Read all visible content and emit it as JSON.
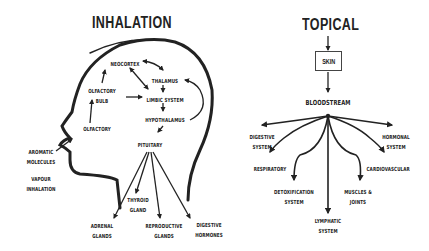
{
  "inhalation": {
    "title": "INHALATION",
    "nodes": {
      "neocortex": "NEOCORTEX",
      "thalamus": "THALAMUS",
      "olfactory_bulb_1": "OLFACTORY",
      "olfactory_bulb_2": "BULB",
      "limbic_system": "LIMBIC SYSTEM",
      "hypothalamus": "HYPOTHALAMUS",
      "olfactory": "OLFACTORY",
      "pituitary": "PITUITARY",
      "aromatic_1": "AROMATIC",
      "aromatic_2": "MOLECULES",
      "vapour_1": "VAPOUR",
      "vapour_2": "INHALATION",
      "thyroid_1": "THYROID",
      "thyroid_2": "GLAND",
      "adrenal_1": "ADRENAL",
      "adrenal_2": "GLANDS",
      "reproductive_1": "REPRODUCTIVE",
      "reproductive_2": "GLANDS",
      "digestive_1": "DIGESTIVE",
      "digestive_2": "HORMONES"
    }
  },
  "topical": {
    "title": "TOPICAL",
    "skin": "SKIN",
    "bloodstream": "BLOODSTREAM",
    "nodes": {
      "digestive_1": "DIGESTIVE",
      "digestive_2": "SYSTEM",
      "hormonal_1": "HORMONAL",
      "hormonal_2": "SYSTEM",
      "respiratory": "RESPIRATORY",
      "cardiovascular": "CARDIOVASCULAR",
      "detox_1": "DETOXIFICATION",
      "detox_2": "SYSTEM",
      "muscles_1": "MUSCLES &",
      "muscles_2": "JOINTS",
      "lymphatic_1": "LYMPHATIC",
      "lymphatic_2": "SYSTEM"
    }
  },
  "colors": {
    "ink": "#222222",
    "background": "#ffffff"
  }
}
